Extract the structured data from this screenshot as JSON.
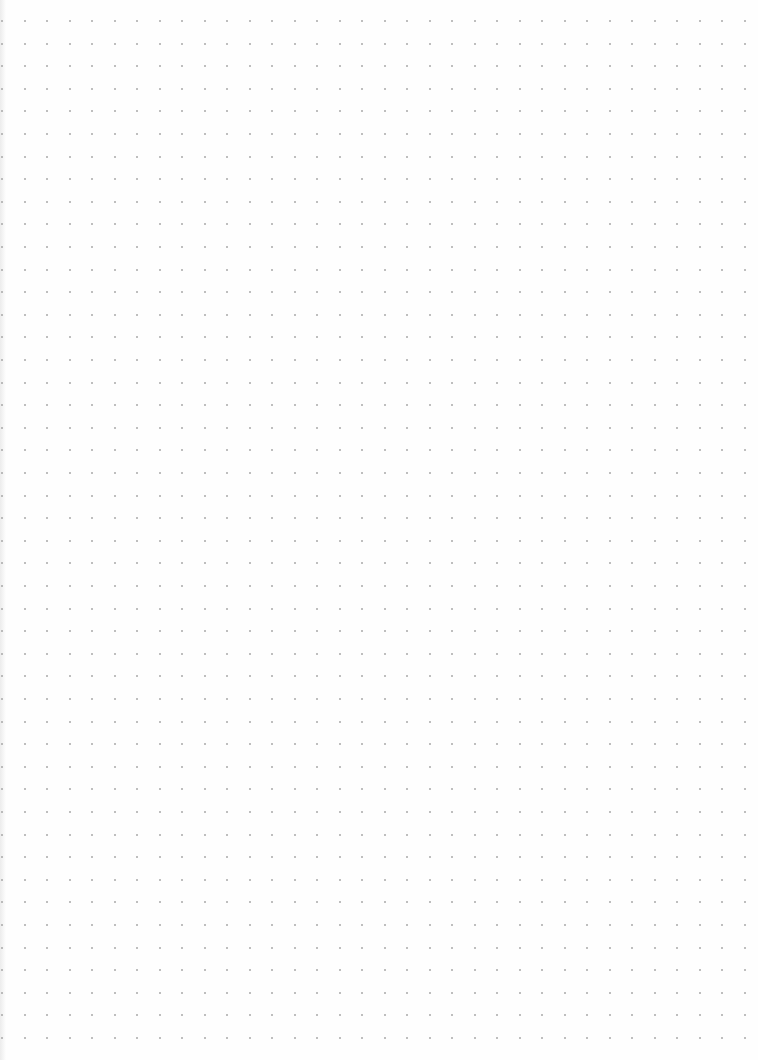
{
  "page": {
    "type": "dot-grid-paper",
    "background_color": "#fefefe",
    "dot_color": "#a8a8a8"
  },
  "grid": {
    "origin_x": 2,
    "origin_y": 21,
    "spacing_x": 22.5,
    "spacing_y": 22.6,
    "columns": 34,
    "rows": 46,
    "dot_size": 2
  }
}
